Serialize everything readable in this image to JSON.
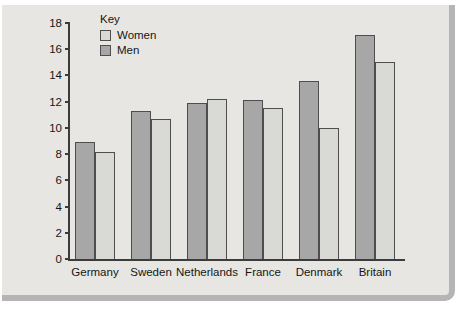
{
  "page": {
    "background_color": "#ffffff"
  },
  "panel": {
    "background_color": "#e7e6e3",
    "frame_color": "#b5b5b5"
  },
  "chart_data": {
    "type": "bar",
    "title": "",
    "xlabel": "",
    "ylabel": "",
    "grid": false,
    "legend_position": "top-left-inside",
    "categories": [
      "Germany",
      "Sweden",
      "Netherlands",
      "France",
      "Denmark",
      "Britain"
    ],
    "series": [
      {
        "name": "Men",
        "color": "#a7a7a7",
        "values": [
          8.9,
          11.3,
          11.9,
          12.1,
          13.6,
          17.1
        ]
      },
      {
        "name": "Women",
        "color": "#d9d9d6",
        "values": [
          8.2,
          10.7,
          12.2,
          11.5,
          10,
          15
        ]
      }
    ],
    "legend": {
      "title": "Key",
      "items": [
        {
          "label": "Women",
          "color": "#d9d9d6"
        },
        {
          "label": "Men",
          "color": "#a7a7a7"
        }
      ]
    },
    "ylim": [
      0,
      18
    ],
    "yticks": [
      0,
      2,
      4,
      6,
      8,
      10,
      12,
      14,
      16,
      18
    ],
    "colors": {
      "axis": "#3c3c3c",
      "bar_outline": "#4e4e4e",
      "text": "#161616"
    }
  }
}
